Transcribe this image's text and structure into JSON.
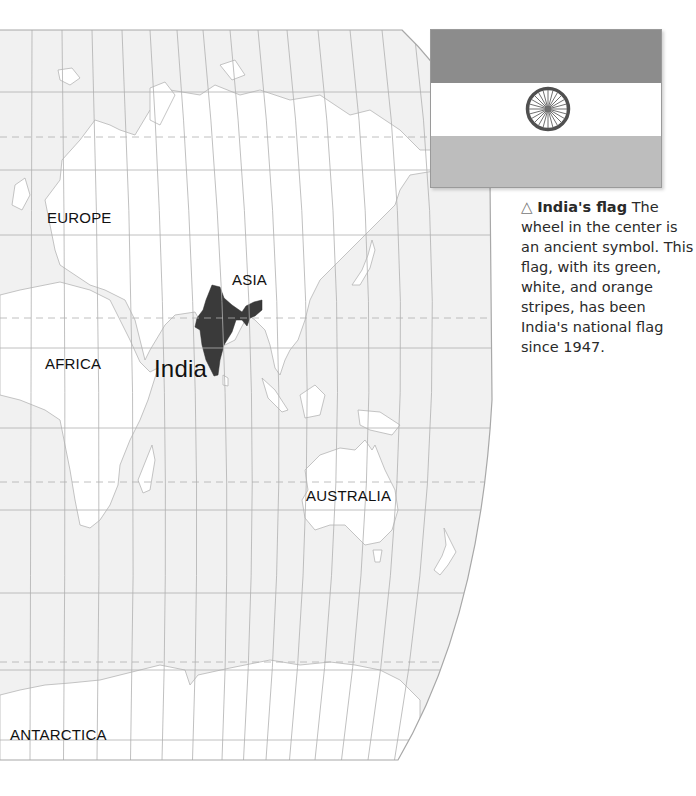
{
  "map": {
    "labels": {
      "europe": "EUROPE",
      "asia": "ASIA",
      "africa": "AFRICA",
      "india": "India",
      "australia": "AUSTRALIA",
      "antarctica": "ANTARCTICA"
    },
    "colors": {
      "ocean": "#f1f1f1",
      "land": "#ffffff",
      "coastline": "#b5b5b5",
      "grid": "#b0b0b0",
      "highlight": "#3a3a3a"
    },
    "highlighted_country": "India"
  },
  "flag": {
    "name": "India's flag",
    "stripes": [
      "orange",
      "white",
      "green"
    ],
    "stripe_colors": [
      "#8c8c8c",
      "#ffffff",
      "#bdbdbd"
    ],
    "emblem": "wheel",
    "wheel_color": "#505050"
  },
  "caption": {
    "icon": "triangle-up-outline",
    "icon_glyph": "△",
    "title": "India's flag",
    "body": " The wheel in the center is an ancient symbol. This flag, with its green, white, and orange stripes, has been India's national flag since 1947."
  }
}
